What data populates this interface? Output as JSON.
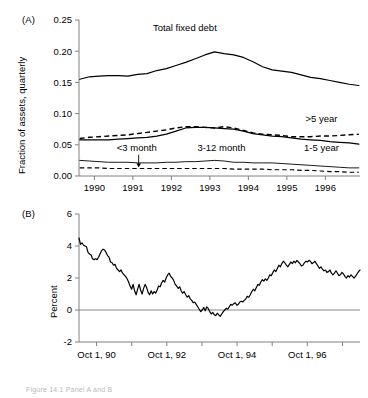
{
  "figure": {
    "caption_partial": "Figure 14.1  Panel A and B",
    "panel_a_tag": "(A)",
    "panel_b_tag": "(B)"
  },
  "chart_data": [
    {
      "type": "line",
      "panel": "(A)",
      "title": "",
      "xlabel": "",
      "ylabel": "Fraction of assets, quarterly",
      "ylim": [
        0.0,
        0.25
      ],
      "yticks": [
        0.0,
        0.05,
        0.1,
        0.15,
        0.2,
        0.25
      ],
      "ytick_labels": [
        "0.00",
        "0.05",
        "0.10",
        "0.15",
        "0.20",
        "0.25"
      ],
      "xlim": [
        1989.6,
        1996.9
      ],
      "xticks": [
        1990,
        1991,
        1992,
        1993,
        1994,
        1995,
        1996
      ],
      "xtick_labels": [
        "1990",
        "1991",
        "1992",
        "1993",
        "1994",
        "1995",
        "1996"
      ],
      "grid": false,
      "legend": "inline-annotations",
      "x": [
        1989.62,
        1989.87,
        1990.12,
        1990.37,
        1990.62,
        1990.87,
        1991.12,
        1991.37,
        1991.62,
        1991.87,
        1992.12,
        1992.37,
        1992.62,
        1992.87,
        1993.12,
        1993.37,
        1993.62,
        1993.87,
        1994.12,
        1994.37,
        1994.62,
        1994.87,
        1995.12,
        1995.37,
        1995.62,
        1995.87,
        1996.12,
        1996.37,
        1996.62,
        1996.87
      ],
      "series": [
        {
          "name": "Total fixed debt",
          "style": "solid",
          "values": [
            0.155,
            0.159,
            0.16,
            0.161,
            0.161,
            0.16,
            0.163,
            0.164,
            0.169,
            0.172,
            0.177,
            0.182,
            0.188,
            0.194,
            0.199,
            0.196,
            0.194,
            0.19,
            0.183,
            0.175,
            0.17,
            0.168,
            0.166,
            0.162,
            0.158,
            0.156,
            0.153,
            0.15,
            0.147,
            0.145
          ]
        },
        {
          "name": ">5 year",
          "style": "dashed",
          "values": [
            0.06,
            0.062,
            0.063,
            0.064,
            0.065,
            0.066,
            0.068,
            0.07,
            0.072,
            0.074,
            0.077,
            0.079,
            0.079,
            0.078,
            0.077,
            0.079,
            0.077,
            0.073,
            0.069,
            0.067,
            0.066,
            0.065,
            0.063,
            0.063,
            0.063,
            0.064,
            0.064,
            0.065,
            0.066,
            0.067
          ]
        },
        {
          "name": "1-5 year",
          "style": "solid",
          "values": [
            0.058,
            0.058,
            0.058,
            0.058,
            0.059,
            0.06,
            0.061,
            0.062,
            0.064,
            0.067,
            0.072,
            0.077,
            0.078,
            0.078,
            0.077,
            0.076,
            0.075,
            0.072,
            0.068,
            0.066,
            0.064,
            0.063,
            0.061,
            0.059,
            0.058,
            0.057,
            0.055,
            0.054,
            0.053,
            0.051
          ]
        },
        {
          "name": "3-12 month",
          "style": "solid-thin",
          "values": [
            0.025,
            0.024,
            0.023,
            0.022,
            0.022,
            0.022,
            0.021,
            0.021,
            0.021,
            0.022,
            0.022,
            0.023,
            0.023,
            0.024,
            0.025,
            0.024,
            0.022,
            0.022,
            0.021,
            0.021,
            0.021,
            0.02,
            0.019,
            0.018,
            0.017,
            0.016,
            0.015,
            0.014,
            0.013,
            0.013
          ]
        },
        {
          "name": "<3 month",
          "style": "dashed-thin",
          "values": [
            0.013,
            0.013,
            0.013,
            0.012,
            0.012,
            0.012,
            0.012,
            0.012,
            0.012,
            0.012,
            0.012,
            0.012,
            0.012,
            0.012,
            0.012,
            0.012,
            0.011,
            0.011,
            0.011,
            0.011,
            0.01,
            0.01,
            0.01,
            0.009,
            0.009,
            0.008,
            0.007,
            0.007,
            0.006,
            0.006
          ]
        }
      ],
      "annotations": [
        {
          "text": "Total fixed debt",
          "x": 1992.35,
          "y": 0.232
        },
        {
          "text": ">5 year",
          "x": 1995.9,
          "y": 0.087
        },
        {
          "text": "1-5 year",
          "x": 1995.9,
          "y": 0.04
        },
        {
          "text": "3-12 month",
          "x": 1993.3,
          "y": 0.04
        },
        {
          "text": "<3 month",
          "x": 1991.1,
          "y": 0.04
        }
      ]
    },
    {
      "type": "line",
      "panel": "(B)",
      "title": "",
      "xlabel": "",
      "ylabel": "Percent",
      "ylim": [
        -2,
        6
      ],
      "yticks": [
        -2,
        0,
        2,
        4,
        6
      ],
      "ytick_labels": [
        "-2",
        "0",
        "2",
        "4",
        "6"
      ],
      "xtick_labels": [
        "Oct 1, 90",
        "Oct 1, 92",
        "Oct 1, 94",
        "Oct 1, 96"
      ],
      "grid": false,
      "zero_line": true,
      "values": [
        4.5,
        4.1,
        4.2,
        4.05,
        4.0,
        3.95,
        3.6,
        3.5,
        3.45,
        3.2,
        3.15,
        3.2,
        3.15,
        3.3,
        3.5,
        3.7,
        3.8,
        3.75,
        3.6,
        3.4,
        3.3,
        3.0,
        2.95,
        2.8,
        2.85,
        2.6,
        2.5,
        2.4,
        2.5,
        2.3,
        2.2,
        2.1,
        1.95,
        1.75,
        1.5,
        1.3,
        1.6,
        1.2,
        0.95,
        1.3,
        1.6,
        1.25,
        1.0,
        1.35,
        1.6,
        1.4,
        1.1,
        0.95,
        1.2,
        1.0,
        1.15,
        1.05,
        1.25,
        1.5,
        1.45,
        1.7,
        1.85,
        1.75,
        2.0,
        2.2,
        2.3,
        2.1,
        2.0,
        1.85,
        1.6,
        1.5,
        1.35,
        1.45,
        1.2,
        1.05,
        1.15,
        0.95,
        0.8,
        0.9,
        0.7,
        0.6,
        0.45,
        0.5,
        0.35,
        0.2,
        0.05,
        -0.1,
        0.0,
        0.15,
        -0.05,
        0.2,
        0.1,
        -0.1,
        -0.25,
        -0.15,
        -0.3,
        -0.35,
        -0.2,
        -0.3,
        -0.4,
        -0.25,
        -0.1,
        0.0,
        0.1,
        0.05,
        0.2,
        0.35,
        0.3,
        0.4,
        0.45,
        0.3,
        0.35,
        0.5,
        0.55,
        0.5,
        0.6,
        0.7,
        0.85,
        0.8,
        0.95,
        1.15,
        1.3,
        1.2,
        1.4,
        1.6,
        1.55,
        1.75,
        1.9,
        1.8,
        1.95,
        1.85,
        2.0,
        2.2,
        2.15,
        2.35,
        2.5,
        2.4,
        2.6,
        2.8,
        2.7,
        2.9,
        3.05,
        2.95,
        2.8,
        2.7,
        2.85,
        3.0,
        2.9,
        3.05,
        2.95,
        3.1,
        3.0,
        2.9,
        2.75,
        2.8,
        2.95,
        3.05,
        3.0,
        3.1,
        3.05,
        2.9,
        2.95,
        3.05,
        2.9,
        2.75,
        2.6,
        2.7,
        2.55,
        2.45,
        2.5,
        2.35,
        2.4,
        2.5,
        2.3,
        2.2,
        2.3,
        2.45,
        2.3,
        2.15,
        2.2,
        2.35,
        2.25,
        2.1,
        2.0,
        2.15,
        2.05,
        2.2,
        2.1,
        2.0,
        2.1,
        2.25,
        2.4,
        2.5
      ]
    }
  ]
}
